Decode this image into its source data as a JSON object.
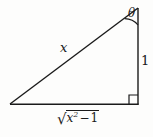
{
  "figure": {
    "kind": "right-triangle-trig-diagram",
    "background_color": "#fdfdfc",
    "stroke_color": "#1a1a1a",
    "labels": {
      "hypotenuse": "x",
      "opposite_side": "1",
      "angle": "θ",
      "base_radical_sign": "√",
      "base_radicand_variable": "x",
      "base_radicand_exponent": "2",
      "base_radicand_operator": "−",
      "base_radicand_constant": "1",
      "base_full_text": "√(x² − 1)"
    },
    "geometry": {
      "vertex_left": [
        10,
        104
      ],
      "vertex_top_right": [
        138,
        8
      ],
      "vertex_bottom_right": [
        138,
        104
      ],
      "right_angle_marker_size": 9,
      "angle_arc_radius": 17
    }
  }
}
